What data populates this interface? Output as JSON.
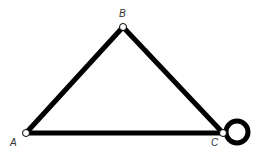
{
  "diagram": {
    "type": "graph",
    "nodes": [
      {
        "id": "A",
        "label": "A",
        "x": 26,
        "y": 133
      },
      {
        "id": "B",
        "label": "B",
        "x": 123,
        "y": 27
      },
      {
        "id": "C",
        "label": "C",
        "x": 223,
        "y": 133
      }
    ],
    "edges": [
      {
        "from": "A",
        "to": "B"
      },
      {
        "from": "B",
        "to": "C"
      },
      {
        "from": "A",
        "to": "C"
      },
      {
        "from": "C",
        "to": "C",
        "kind": "self-loop"
      }
    ],
    "colors": {
      "edge": "#000000",
      "node_fill": "#ffffff",
      "background": "#ffffff"
    }
  }
}
